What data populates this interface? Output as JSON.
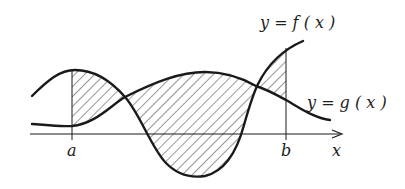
{
  "diagram": {
    "labels": {
      "f_curve": "y = f ( x )",
      "g_curve": "y = g ( x )",
      "a": "a",
      "b": "b",
      "x_axis": "x"
    },
    "colors": {
      "stroke": "#1a1a1a",
      "hatch": "#333333",
      "background": "#ffffff"
    },
    "regions": [
      {
        "name": "region-1",
        "from": "a",
        "to": "first intersection",
        "shaded": true
      },
      {
        "name": "region-2",
        "from": "first intersection",
        "to": "second intersection",
        "shaded": true
      },
      {
        "name": "region-3",
        "from": "second intersection",
        "to": "b",
        "shaded": true
      }
    ]
  }
}
